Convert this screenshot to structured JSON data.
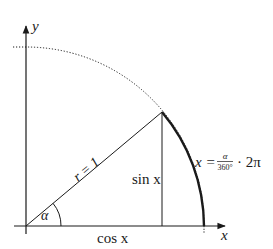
{
  "diagram": {
    "type": "unit-circle",
    "angle_deg": 40,
    "labels": {
      "y_axis": "y",
      "x_axis": "x",
      "radius": "r = 1",
      "angle": "α",
      "sin": "sin x",
      "cos": "cos x",
      "arc_lhs": "x =",
      "arc_num": "α",
      "arc_den": "360°",
      "arc_rhs": "· 2π"
    },
    "colors": {
      "line": "#1a1a1a",
      "background": "#ffffff"
    }
  }
}
